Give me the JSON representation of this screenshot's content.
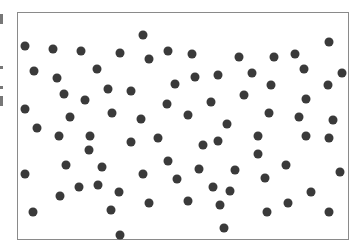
{
  "chart_data": {
    "type": "scatter",
    "title": "",
    "xlabel": "",
    "ylabel": "",
    "grid": false,
    "legend": null,
    "frame": {
      "x": 17,
      "y": 12,
      "width": 332,
      "height": 228
    },
    "marker": {
      "color": "#3a3a3a",
      "radius": 4.5
    },
    "points": [
      [
        25,
        46
      ],
      [
        53,
        49
      ],
      [
        81,
        51
      ],
      [
        120,
        53
      ],
      [
        143,
        35
      ],
      [
        168,
        51
      ],
      [
        192,
        54
      ],
      [
        239,
        57
      ],
      [
        274,
        57
      ],
      [
        295,
        54
      ],
      [
        329,
        42
      ],
      [
        34,
        71
      ],
      [
        57,
        78
      ],
      [
        97,
        69
      ],
      [
        149,
        59
      ],
      [
        195,
        77
      ],
      [
        218,
        75
      ],
      [
        252,
        73
      ],
      [
        304,
        69
      ],
      [
        342,
        73
      ],
      [
        64,
        94
      ],
      [
        85,
        100
      ],
      [
        108,
        89
      ],
      [
        131,
        91
      ],
      [
        175,
        84
      ],
      [
        271,
        85
      ],
      [
        328,
        85
      ],
      [
        25,
        109
      ],
      [
        70,
        117
      ],
      [
        112,
        113
      ],
      [
        167,
        104
      ],
      [
        211,
        102
      ],
      [
        244,
        95
      ],
      [
        306,
        99
      ],
      [
        37,
        128
      ],
      [
        141,
        119
      ],
      [
        188,
        115
      ],
      [
        227,
        124
      ],
      [
        269,
        113
      ],
      [
        299,
        117
      ],
      [
        333,
        120
      ],
      [
        59,
        136
      ],
      [
        90,
        136
      ],
      [
        89,
        150
      ],
      [
        131,
        142
      ],
      [
        158,
        138
      ],
      [
        203,
        145
      ],
      [
        218,
        141
      ],
      [
        258,
        136
      ],
      [
        306,
        136
      ],
      [
        329,
        138
      ],
      [
        168,
        161
      ],
      [
        258,
        154
      ],
      [
        25,
        174
      ],
      [
        66,
        165
      ],
      [
        102,
        167
      ],
      [
        143,
        174
      ],
      [
        177,
        179
      ],
      [
        199,
        169
      ],
      [
        235,
        170
      ],
      [
        286,
        165
      ],
      [
        340,
        172
      ],
      [
        79,
        187
      ],
      [
        98,
        185
      ],
      [
        213,
        187
      ],
      [
        230,
        191
      ],
      [
        265,
        178
      ],
      [
        311,
        192
      ],
      [
        60,
        196
      ],
      [
        119,
        192
      ],
      [
        149,
        203
      ],
      [
        188,
        201
      ],
      [
        220,
        205
      ],
      [
        288,
        203
      ],
      [
        33,
        212
      ],
      [
        111,
        210
      ],
      [
        267,
        212
      ],
      [
        329,
        212
      ],
      [
        224,
        228
      ],
      [
        120,
        235
      ]
    ]
  }
}
